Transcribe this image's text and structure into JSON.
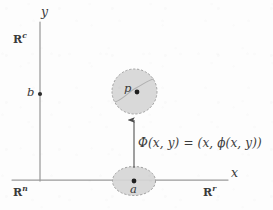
{
  "figure": {
    "type": "mathematical-diagram",
    "width": 273,
    "height": 210,
    "background_color": "#fdfdfd",
    "ink_color": "#3a3a3a",
    "axis_color": "#9a9a9a",
    "region_fill_color": "#d6d6d6",
    "region_border_color": "#9e9e9e"
  },
  "axes": {
    "vertical": {
      "label": "y",
      "x": 40,
      "y_top": 22,
      "y_bottom": 181
    },
    "horizontal": {
      "label": "x",
      "y": 180,
      "x_left": 12,
      "x_right": 228
    }
  },
  "space_labels": {
    "codomain_factor": {
      "symbol": "R",
      "superscript": "c",
      "x": 13,
      "y": 32
    },
    "total_space": {
      "symbol": "R",
      "superscript": "n",
      "x": 13,
      "y": 185
    },
    "domain_factor": {
      "symbol": "R",
      "superscript": "r",
      "x": 203,
      "y": 185
    }
  },
  "points": [
    {
      "label": "b",
      "cx": 40,
      "cy": 94,
      "label_x": 27,
      "label_y": 88,
      "radius": 2.1
    },
    {
      "label": "a",
      "cx": 134,
      "cy": 181,
      "label_x": 130,
      "label_y": 186,
      "radius": 2.4
    },
    {
      "label": "p",
      "cx": 137,
      "cy": 92,
      "label_x": 124,
      "label_y": 83,
      "radius": 2.4
    }
  ],
  "regions": [
    {
      "name": "neighborhood-of-a",
      "shape": "ellipse",
      "cx": 134,
      "cy": 181,
      "rx": 21.5,
      "ry": 14.5
    },
    {
      "name": "neighborhood-of-p",
      "shape": "circle",
      "cx": 134.5,
      "cy": 91.5,
      "r": 22.5
    }
  ],
  "graph_curve": {
    "name": "graph-of-phi",
    "path": "M 115 102 C 124 99, 128 92, 136 88 C 143 84.5, 148 80, 154 79"
  },
  "arrow": {
    "name": "map-arrow",
    "x": 134,
    "y_tail": 168,
    "y_head": 118
  },
  "formula": {
    "text": "Φ(x, y) = (x, ϕ(x, y))",
    "x": 138,
    "y": 137
  }
}
